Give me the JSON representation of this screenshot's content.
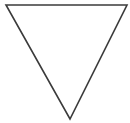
{
  "canvas": {
    "width": 130,
    "height": 123,
    "background_color": "#ffffff",
    "title": "Inverted Triangle"
  },
  "figure": {
    "name": "inverted-triangle",
    "orientation": "point-down",
    "fill": "none",
    "fill_color": "#ffffff",
    "stroke_color": "#3b3b3b",
    "stroke_width": 1.6,
    "vertices": [
      {
        "label": "top-left",
        "x": 6,
        "y": 5
      },
      {
        "label": "top-right",
        "x": 127,
        "y": 5
      },
      {
        "label": "bottom-apex",
        "x": 70,
        "y": 119
      }
    ],
    "points_attr": "6,5 127,5 70,119"
  }
}
